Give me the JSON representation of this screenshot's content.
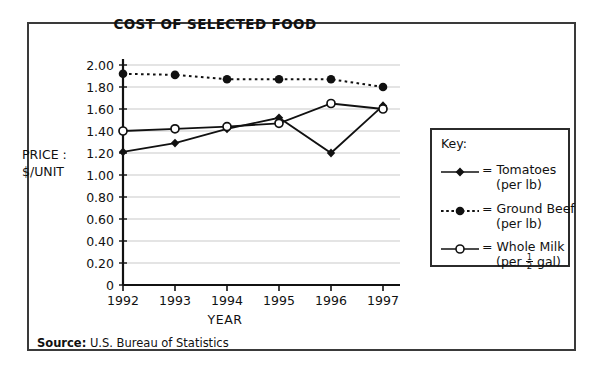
{
  "figure": {
    "title": "COST OF SELECTED FOOD",
    "source_label": "Source:",
    "source_text": "U.S. Bureau of Statistics",
    "frame_color": "#3a3a3a"
  },
  "axes": {
    "ylabel_line1": "PRICE :",
    "ylabel_line2": "$/UNIT",
    "xlabel": "YEAR",
    "yticks": [
      "0",
      "0.20",
      "0.40",
      "0.60",
      "0.80",
      "1.00",
      "1.20",
      "1.40",
      "1.60",
      "1.80",
      "2.00"
    ],
    "xticks": [
      "1992",
      "1993",
      "1994",
      "1995",
      "1996",
      "1997"
    ]
  },
  "legend": {
    "title": "Key:",
    "entries": [
      {
        "label": "= Tomatoes",
        "sub": "(per lb)",
        "marker": "filled-diamond",
        "line": "solid"
      },
      {
        "label": "= Ground Beef",
        "sub": "(per lb)",
        "marker": "filled-circle",
        "line": "dotted"
      },
      {
        "label": "= Whole Milk",
        "sub_prefix": "(per ",
        "sub_frac_num": "1",
        "sub_frac_den": "2",
        "sub_suffix": " gal)",
        "marker": "open-circle",
        "line": "solid"
      }
    ]
  },
  "chart_data": {
    "type": "line",
    "title": "COST OF SELECTED FOOD",
    "xlabel": "YEAR",
    "ylabel": "PRICE : $/UNIT",
    "categories": [
      "1992",
      "1993",
      "1994",
      "1995",
      "1996",
      "1997"
    ],
    "ylim": [
      0,
      2.0
    ],
    "ytick_step": 0.2,
    "grid": true,
    "legend_position": "right-outside",
    "series": [
      {
        "name": "Tomatoes",
        "unit": "per lb",
        "marker": "filled-diamond",
        "line": "solid",
        "color": "#111111",
        "values": [
          1.21,
          1.29,
          1.42,
          1.52,
          1.2,
          1.63
        ]
      },
      {
        "name": "Ground Beef",
        "unit": "per lb",
        "marker": "filled-circle",
        "line": "dotted",
        "color": "#111111",
        "values": [
          1.92,
          1.91,
          1.87,
          1.87,
          1.87,
          1.8
        ]
      },
      {
        "name": "Whole Milk",
        "unit": "per 1/2 gal",
        "marker": "open-circle",
        "line": "solid",
        "color": "#111111",
        "values": [
          1.4,
          1.42,
          1.44,
          1.47,
          1.65,
          1.6
        ]
      }
    ]
  }
}
